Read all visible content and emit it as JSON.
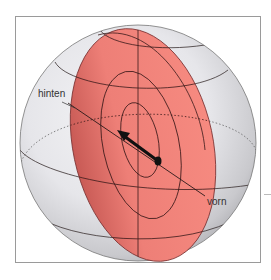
{
  "figure": {
    "type": "sphere-diagram",
    "labels": {
      "back": "hinten",
      "front": "vorn"
    },
    "colors": {
      "plane_fill": "#f08078",
      "plane_stroke": "#8a2a2a",
      "sphere_light": "#f0f0f2",
      "sphere_dark": "#b8b8bc",
      "grid_line": "#3a2a2a",
      "arrow": "#111111",
      "frame": "#9a9a9a"
    },
    "elements": {
      "sphere": "sphere with latitude and longitude lines",
      "plane": "tilted red cross-section plane through the center",
      "contours": "concentric elliptical rings on the plane",
      "arrow": "black arrow on the plane pointing from front to back"
    }
  }
}
